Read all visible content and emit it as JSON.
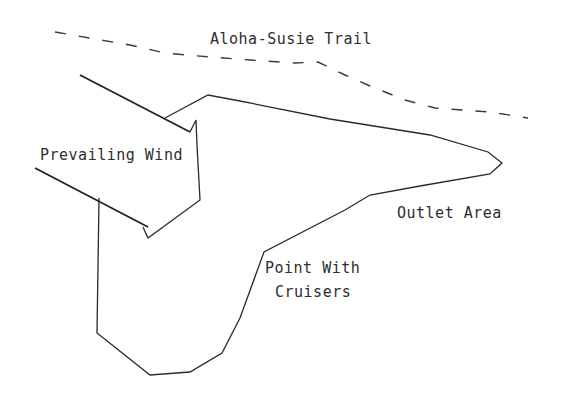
{
  "diagram": {
    "labels": {
      "trail": "Aloha-Susie Trail",
      "wind": "Prevailing Wind",
      "outlet": "Outlet Area",
      "point_line1": "Point With",
      "point_line2": "Cruisers"
    },
    "colors": {
      "background": "#ffffff",
      "line": "#2a2a2a",
      "text": "#2e2e2e"
    }
  }
}
